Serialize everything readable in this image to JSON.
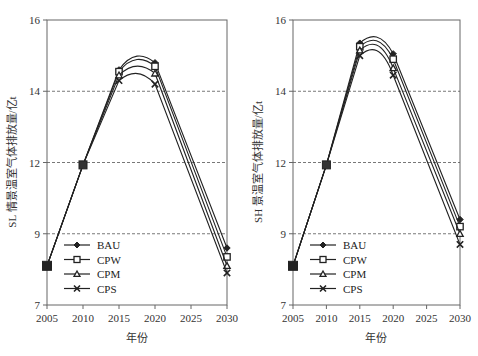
{
  "chart_data": [
    {
      "type": "line",
      "title": "",
      "xlabel": "年份",
      "ylabel": "SL 情景温室气体排放量/亿t",
      "x": [
        2005,
        2010,
        2015,
        2020,
        2030
      ],
      "xticks": [
        "2005",
        "2010",
        "2015",
        "2020",
        "2025",
        "2030"
      ],
      "yticks": [
        "7",
        "9",
        "12",
        "14",
        "16"
      ],
      "ylim": [
        7,
        16
      ],
      "grid": "dashed horizontal at y ticks",
      "legend_position": "lower-left inside",
      "series": [
        {
          "name": "BAU",
          "marker": "diamond",
          "values": [
            8.1,
            11.9,
            14.6,
            14.8,
            8.6
          ]
        },
        {
          "name": "CPW",
          "marker": "square",
          "values": [
            8.1,
            11.9,
            14.55,
            14.7,
            8.35
          ]
        },
        {
          "name": "CPM",
          "marker": "triangle",
          "values": [
            8.1,
            11.9,
            14.45,
            14.5,
            8.1
          ]
        },
        {
          "name": "CPS",
          "marker": "x",
          "values": [
            8.1,
            11.9,
            14.3,
            14.2,
            7.9
          ]
        }
      ]
    },
    {
      "type": "line",
      "title": "",
      "xlabel": "年份",
      "ylabel": "SH 景温室气体排放量/亿t",
      "x": [
        2005,
        2010,
        2015,
        2020,
        2030
      ],
      "xticks": [
        "2005",
        "2010",
        "2015",
        "2020",
        "2025",
        "2030"
      ],
      "yticks": [
        "7",
        "9",
        "12",
        "14",
        "16"
      ],
      "ylim": [
        7,
        16
      ],
      "grid": "dashed horizontal at y ticks",
      "legend_position": "lower-left inside",
      "series": [
        {
          "name": "BAU",
          "marker": "diamond",
          "values": [
            8.1,
            11.9,
            15.35,
            15.05,
            9.6
          ]
        },
        {
          "name": "CPW",
          "marker": "square",
          "values": [
            8.1,
            11.9,
            15.25,
            14.9,
            9.3
          ]
        },
        {
          "name": "CPM",
          "marker": "triangle",
          "values": [
            8.1,
            11.9,
            15.15,
            14.65,
            9.0
          ]
        },
        {
          "name": "CPS",
          "marker": "x",
          "values": [
            8.1,
            11.9,
            15.0,
            14.45,
            8.7
          ]
        }
      ]
    }
  ],
  "colors": {
    "line": "#222222",
    "grid": "#555555",
    "axis": "#666666"
  }
}
